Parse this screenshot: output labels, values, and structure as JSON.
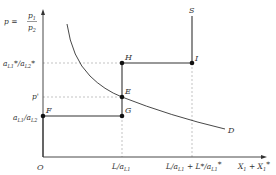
{
  "diagram": {
    "y_axis_label": "p = p1 / p2",
    "y_axis_label_parts": {
      "lhs": "p =",
      "num": "p",
      "num_sub": "1",
      "den": "p",
      "den_sub": "2"
    },
    "x_axis_label": "X1 + X1*",
    "origin_label": "O",
    "y_ticks": [
      {
        "label": "aL1*/aL2*",
        "y": 63
      },
      {
        "label": "p'",
        "y": 97
      },
      {
        "label": "aL1/aL2",
        "y": 116
      }
    ],
    "x_ticks": [
      {
        "label": "L/aL1",
        "x": 122
      },
      {
        "label": "L/aL1 + L*/aL1*",
        "x": 192
      }
    ],
    "points": [
      {
        "name": "F",
        "x": 43,
        "y": 116
      },
      {
        "name": "G",
        "x": 122,
        "y": 116
      },
      {
        "name": "E",
        "x": 122,
        "y": 97
      },
      {
        "name": "H",
        "x": 122,
        "y": 63
      },
      {
        "name": "I",
        "x": 192,
        "y": 63
      }
    ],
    "curves": {
      "supply_label": "S",
      "demand_label": "D"
    },
    "colors": {
      "line": "#333333",
      "dash": "#aaaaaa",
      "point": "#111111"
    }
  }
}
